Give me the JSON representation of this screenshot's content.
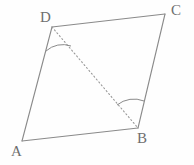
{
  "figure": {
    "kind": "geometry-diagram",
    "shape_name": "parallelogram",
    "background_color": "#fefefe",
    "stroke_color": "#8a8a8a",
    "dash_color": "#9a9a9a",
    "arc_color": "#8a8a8a",
    "label_color": "#6f6f6f",
    "canvas": {
      "width": 194,
      "height": 165
    },
    "vertices": [
      {
        "id": "A",
        "label": "A",
        "x": 22,
        "y": 141
      },
      {
        "id": "B",
        "label": "B",
        "x": 138,
        "y": 128
      },
      {
        "id": "C",
        "label": "C",
        "x": 165,
        "y": 14
      },
      {
        "id": "D",
        "label": "D",
        "x": 52,
        "y": 27
      }
    ],
    "solid_edges": [
      {
        "id": "AB",
        "from": "A",
        "to": "B",
        "points": "22,141 138,128"
      },
      {
        "id": "BC",
        "from": "B",
        "to": "C",
        "points": "138,128 165,14"
      },
      {
        "id": "CD",
        "from": "C",
        "to": "D",
        "points": "165,14 52,27"
      },
      {
        "id": "DA",
        "from": "D",
        "to": "A",
        "points": "52,27 22,141"
      }
    ],
    "dashed_edges": [
      {
        "id": "DB",
        "from": "D",
        "to": "B",
        "points": "52,27 138,128",
        "style": "dotted"
      }
    ],
    "angle_arcs": [
      {
        "id": "angle-D",
        "at": "D",
        "between": [
          "DA",
          "DB"
        ],
        "path": "M 46,51 A 25,25 0 0 1 71,46"
      },
      {
        "id": "angle-B",
        "at": "B",
        "between": [
          "BD",
          "BC"
        ],
        "path": "M 117,105 A 27,27 0 0 1 144,101"
      }
    ]
  }
}
